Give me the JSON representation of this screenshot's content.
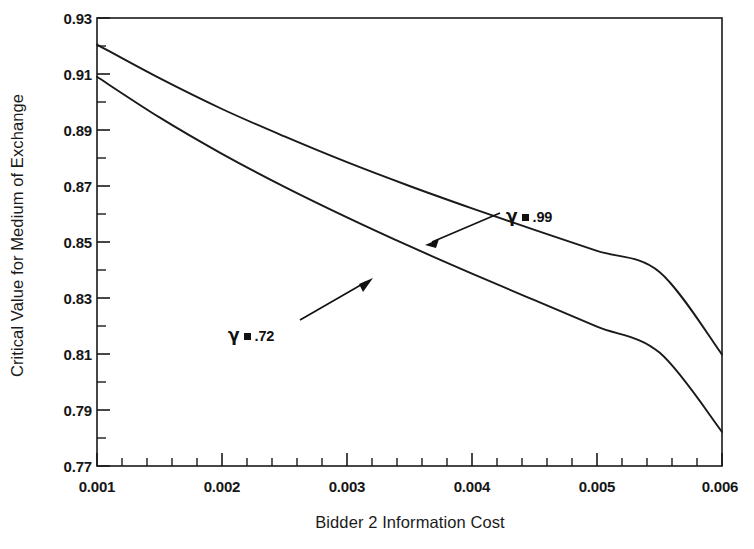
{
  "chart_data": {
    "type": "line",
    "title": "",
    "xlabel": "Bidder 2 Information Cost",
    "ylabel": "Critical Value for Medium of Exchange",
    "xlim": [
      0.001,
      0.006
    ],
    "ylim": [
      0.77,
      0.93
    ],
    "grid": false,
    "legend_position": "inline-annotations",
    "xticks": [
      0.001,
      0.002,
      0.003,
      0.004,
      0.005,
      0.006
    ],
    "xtick_labels": [
      "0.001",
      "0.002",
      "0.003",
      "0.004",
      "0.005",
      "0.006"
    ],
    "xminor_ticks": [
      0.0012,
      0.0014,
      0.0016,
      0.0018,
      0.0022,
      0.0024,
      0.0026,
      0.0028,
      0.0032,
      0.0034,
      0.0036,
      0.0038,
      0.0042,
      0.0044,
      0.0046,
      0.0048,
      0.0052,
      0.0054,
      0.0056,
      0.0058
    ],
    "yticks": [
      0.77,
      0.79,
      0.81,
      0.83,
      0.85,
      0.87,
      0.89,
      0.91,
      0.93
    ],
    "ytick_labels": [
      "0.77",
      "0.79",
      "0.81",
      "0.83",
      "0.85",
      "0.87",
      "0.89",
      "0.91",
      "0.93"
    ],
    "yminor_ticks": [
      0.78,
      0.8,
      0.82,
      0.84,
      0.86,
      0.88,
      0.9,
      0.92
    ],
    "x": [
      0.001,
      0.0015,
      0.002,
      0.0025,
      0.003,
      0.0035,
      0.004,
      0.0045,
      0.005,
      0.0055,
      0.006
    ],
    "series": [
      {
        "name": "gamma = .99",
        "label": ".99",
        "color": "#1a1a1a",
        "values": [
          0.9205,
          0.9085,
          0.8975,
          0.8877,
          0.8785,
          0.87,
          0.862,
          0.8543,
          0.8468,
          0.8393,
          0.8098
        ]
      },
      {
        "name": "gamma = .72",
        "label": ".72",
        "color": "#1a1a1a",
        "values": [
          0.909,
          0.8945,
          0.8815,
          0.8697,
          0.8588,
          0.8485,
          0.8387,
          0.8292,
          0.8198,
          0.8105,
          0.7822
        ]
      }
    ],
    "annotations": [
      {
        "id": "g99",
        "symbol": "γ",
        "value": ".99",
        "points_to_series": "gamma = .99"
      },
      {
        "id": "g72",
        "symbol": "γ",
        "value": ".72",
        "points_to_series": "gamma = .72"
      }
    ]
  },
  "axes": {
    "y_title": "Critical Value for Medium of Exchange",
    "x_title": "Bidder 2 Information Cost"
  },
  "ylabels": {
    "t0": "0.93",
    "t1": "0.91",
    "t2": "0.89",
    "t3": "0.87",
    "t4": "0.85",
    "t5": "0.83",
    "t6": "0.81",
    "t7": "0.79",
    "t8": "0.77"
  },
  "xlabels": {
    "t0": "0.001",
    "t1": "0.002",
    "t2": "0.003",
    "t3": "0.004",
    "t4": "0.005",
    "t5": "0.006"
  },
  "annot": {
    "gamma": "γ",
    "v99": ".99",
    "v72": ".72"
  }
}
